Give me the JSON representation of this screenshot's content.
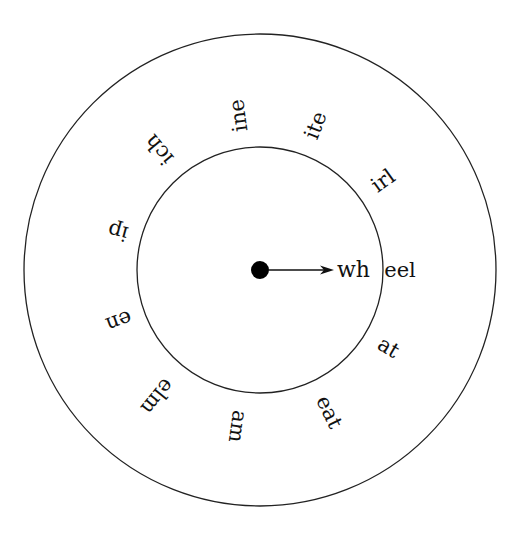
{
  "diagram": {
    "center": {
      "x": 260,
      "y": 270
    },
    "outer_radius": 236,
    "inner_radius": 123,
    "hub": {
      "radius": 9,
      "color": "#000000"
    },
    "arrow": {
      "from_x": 269,
      "to_x": 334,
      "y": 270
    },
    "inner_text": "wh",
    "outer_words": [
      {
        "text": "eel",
        "angle": 0,
        "radius": 140
      },
      {
        "text": "at",
        "angle": 31,
        "radius": 150
      },
      {
        "text": "eat",
        "angle": 64,
        "radius": 158
      },
      {
        "text": "am",
        "angle": 98,
        "radius": 158
      },
      {
        "text": "elm",
        "angle": 129,
        "radius": 163
      },
      {
        "text": "en",
        "angle": 160,
        "radius": 150
      },
      {
        "text": "ip",
        "angle": -165,
        "radius": 147
      },
      {
        "text": "ich",
        "angle": -130,
        "radius": 157
      },
      {
        "text": "ine",
        "angle": -98,
        "radius": 156
      },
      {
        "text": "ite",
        "angle": -69,
        "radius": 155
      },
      {
        "text": "irl",
        "angle": -36,
        "radius": 152
      }
    ],
    "colors": {
      "stroke": "#222222",
      "text": "#111111",
      "background": "#ffffff"
    }
  }
}
